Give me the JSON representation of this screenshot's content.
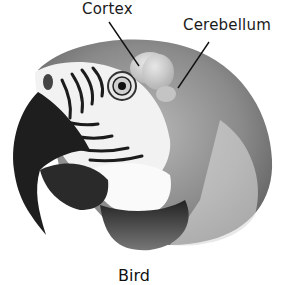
{
  "diagram": {
    "labels": [
      {
        "id": "cortex",
        "text": "Cortex"
      },
      {
        "id": "cerebellum",
        "text": "Cerebellum"
      }
    ],
    "caption": "Bird"
  }
}
